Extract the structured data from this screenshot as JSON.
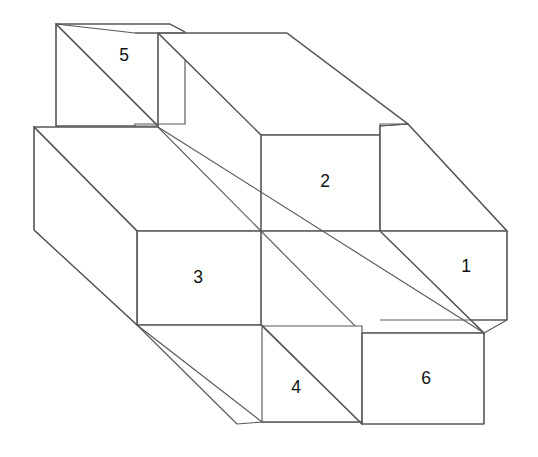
{
  "figure": {
    "background_color": "#ffffff",
    "line_color": "#595959",
    "face_fill_color": "#ffffff",
    "text_color": "#111111",
    "canvas": {
      "width": 538,
      "height": 457
    }
  },
  "labels": [
    {
      "id": "label-1",
      "text": "1",
      "x": 466,
      "y": 267
    },
    {
      "id": "label-2",
      "text": "2",
      "x": 325,
      "y": 182
    },
    {
      "id": "label-3",
      "text": "3",
      "x": 198,
      "y": 278
    },
    {
      "id": "label-4",
      "text": "4",
      "x": 296,
      "y": 388
    },
    {
      "id": "label-5",
      "text": "5",
      "x": 124,
      "y": 56
    },
    {
      "id": "label-6",
      "text": "6",
      "x": 426,
      "y": 379
    }
  ],
  "geometry": {
    "faces": [
      {
        "id": "face-back-left-top",
        "name": "back-block-top-left-face",
        "points": "56,24 170,24 185,32 185,124 135,124 135,126 56,126"
      },
      {
        "id": "face-5-top",
        "name": "face-5-diagonal-panel",
        "points": "56,24 158,126 158,33 135,33"
      },
      {
        "id": "face-front-left-body",
        "name": "front-block-left-top-face",
        "points": "34,127 158,127 261,231 137,231"
      },
      {
        "id": "face-3",
        "name": "face-3-front-panel",
        "points": "137,231 261,231 261,325 137,325"
      },
      {
        "id": "face-left-end",
        "name": "front-block-left-end-face",
        "points": "34,127 137,231 137,325 34,230"
      },
      {
        "id": "face-back-top-long",
        "name": "back-block-top-long-face",
        "points": "158,33 287,33 408,124 380,124 380,135 261,135"
      },
      {
        "id": "face-2",
        "name": "face-2-front-panel",
        "points": "261,135 380,135 380,231 261,231"
      },
      {
        "id": "face-right-top",
        "name": "right-block-top-face",
        "points": "380,126 408,124 507,231 380,231"
      },
      {
        "id": "face-1",
        "name": "face-1-front-panel",
        "points": "380,231 507,231 507,320 380,320"
      },
      {
        "id": "face-front-lower-long",
        "name": "front-block-lower-long-face",
        "points": "261,231 380,231 484,333 362,333"
      },
      {
        "id": "face-4",
        "name": "face-4-front-panel",
        "points": "262,326 362,326 362,422 262,422"
      },
      {
        "id": "face-6",
        "name": "face-6-front-panel",
        "points": "362,333 484,333 484,424 362,424"
      },
      {
        "id": "face-front-bottom-slant",
        "name": "front-block-bottom-slant-face",
        "points": "137,325 262,325 362,424 362,422 262,422"
      }
    ],
    "edges": [
      {
        "id": "edge-top-back-rim",
        "name": "back-block-upper-rim",
        "d": "M 56 24 L 170 24 L 185 32"
      },
      {
        "id": "edge-5-diagonal",
        "name": "face-5-diagonal-edge",
        "d": "M 56 24 L 158 126"
      },
      {
        "id": "edge-5-left",
        "name": "face-5-left-vertical-edge",
        "d": "M 56 24 L 56 126"
      },
      {
        "id": "edge-5-bottom",
        "name": "face-5-bottom-edge",
        "d": "M 56 126 L 158 126"
      },
      {
        "id": "edge-5-right",
        "name": "face-5-right-vertical-edge",
        "d": "M 158 33 L 158 127"
      },
      {
        "id": "edge-back-ledge",
        "name": "back-block-step-ledge",
        "d": "M 135 33 L 185 33"
      },
      {
        "id": "edge-back-top-long",
        "name": "back-block-long-top-edge",
        "d": "M 158 33 L 287 33"
      },
      {
        "id": "edge-back-top-right-diag",
        "name": "back-block-top-right-diagonal",
        "d": "M 287 33 L 408 124"
      },
      {
        "id": "edge-2-left-diag",
        "name": "back-block-inner-left-diagonal",
        "d": "M 158 33 L 261 135"
      },
      {
        "id": "edge-2-top",
        "name": "face-2-top-edge",
        "d": "M 261 135 L 380 135"
      },
      {
        "id": "edge-2-left",
        "name": "face-2-left-vertical-edge",
        "d": "M 261 135 L 261 231"
      },
      {
        "id": "edge-2-right",
        "name": "face-2-right-vertical-edge",
        "d": "M 380 126 L 380 231"
      },
      {
        "id": "edge-right-step",
        "name": "right-block-step-ledge",
        "d": "M 380 126 L 408 124"
      },
      {
        "id": "edge-right-top-diag",
        "name": "right-block-top-diagonal",
        "d": "M 408 124 L 507 231"
      },
      {
        "id": "edge-1-top",
        "name": "face-1-top-edge",
        "d": "M 380 231 L 507 231"
      },
      {
        "id": "edge-1-right",
        "name": "face-1-right-vertical-edge",
        "d": "M 507 231 L 507 320"
      },
      {
        "id": "edge-1-bottom",
        "name": "face-1-bottom-edge",
        "d": "M 380 320 L 507 320"
      },
      {
        "id": "edge-left-top-rim",
        "name": "front-block-left-top-rim",
        "d": "M 34 127 L 158 127"
      },
      {
        "id": "edge-left-vertical",
        "name": "front-block-left-vertical-edge",
        "d": "M 34 127 L 34 230"
      },
      {
        "id": "edge-left-top-diag",
        "name": "front-block-left-upper-diagonal",
        "d": "M 34 127 L 137 231"
      },
      {
        "id": "edge-left-bottom-diag",
        "name": "front-block-left-lower-diagonal",
        "d": "M 34 230 L 137 325"
      },
      {
        "id": "edge-3-top",
        "name": "face-3-top-edge",
        "d": "M 137 231 L 380 231"
      },
      {
        "id": "edge-3-left",
        "name": "face-3-left-vertical-edge",
        "d": "M 137 231 L 137 325"
      },
      {
        "id": "edge-3-bottom",
        "name": "face-3-bottom-edge",
        "d": "M 137 325 L 262 325"
      },
      {
        "id": "edge-3-right",
        "name": "face-3-right-vertical-edge",
        "d": "M 261 231 L 261 326"
      },
      {
        "id": "edge-center-main-diag",
        "name": "front-block-central-diagonal",
        "d": "M 158 127 L 484 333"
      },
      {
        "id": "edge-4-right",
        "name": "face-4-right-vertical-edge",
        "d": "M 362 333 L 362 424"
      },
      {
        "id": "edge-4-left",
        "name": "face-4-left-vertical-edge",
        "d": "M 262 326 L 262 422"
      },
      {
        "id": "edge-4-bottom",
        "name": "face-4-bottom-edge",
        "d": "M 262 422 L 362 422"
      },
      {
        "id": "edge-bottom-slant",
        "name": "front-block-bottom-slant-edge",
        "d": "M 137 325 L 237 424"
      },
      {
        "id": "edge-bottom-slant-2",
        "name": "front-block-bottom-lower-diagonal",
        "d": "M 262 326 L 362 424"
      },
      {
        "id": "edge-6-top",
        "name": "face-6-top-edge",
        "d": "M 362 333 L 484 333"
      },
      {
        "id": "edge-6-right",
        "name": "face-6-right-vertical-edge",
        "d": "M 484 333 L 484 424"
      },
      {
        "id": "edge-6-bottom",
        "name": "face-6-bottom-edge",
        "d": "M 362 424 L 484 424"
      },
      {
        "id": "edge-lower-right-diag",
        "name": "front-block-lower-right-diagonal",
        "d": "M 380 231 L 484 333"
      },
      {
        "id": "edge-bottom-left-join",
        "name": "bottom-left-join-edge",
        "d": "M 237 424 L 262 422"
      },
      {
        "id": "edge-6-right-join",
        "name": "face-6-right-join-edge",
        "d": "M 484 333 L 507 320"
      }
    ]
  }
}
